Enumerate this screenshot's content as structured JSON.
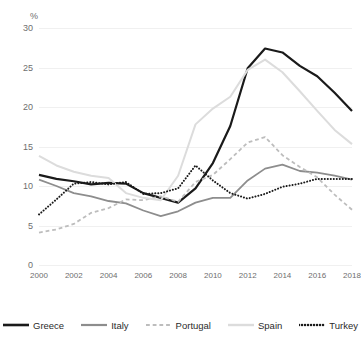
{
  "chart_data": {
    "type": "line",
    "title": "",
    "xlabel": "",
    "ylabel": "%",
    "unit_label": "%",
    "grid": true,
    "legend_position": "bottom",
    "xlim": [
      2000,
      2018
    ],
    "ylim": [
      0,
      30
    ],
    "yticks": [
      0,
      5,
      10,
      15,
      20,
      25,
      30
    ],
    "ytick_labels": [
      "0",
      "5",
      "10",
      "15",
      "20",
      "25",
      "30"
    ],
    "xticks": [
      2000,
      2002,
      2004,
      2006,
      2008,
      2010,
      2012,
      2014,
      2016,
      2018
    ],
    "xtick_labels": [
      "2000",
      "2002",
      "2004",
      "2006",
      "2008",
      "2010",
      "2012",
      "2014",
      "2016",
      "2018"
    ],
    "x": [
      2000,
      2001,
      2002,
      2003,
      2004,
      2005,
      2006,
      2007,
      2008,
      2009,
      2010,
      2011,
      2012,
      2013,
      2014,
      2015,
      2016,
      2017,
      2018
    ],
    "series": [
      {
        "name": "Greece",
        "color": "#1a1a1a",
        "style": "solid",
        "width": 2.2,
        "values": [
          11.4,
          10.9,
          10.6,
          10.2,
          10.4,
          10.3,
          9.1,
          8.5,
          7.9,
          9.7,
          12.9,
          17.6,
          24.9,
          27.4,
          26.9,
          25.2,
          23.9,
          21.8,
          19.5
        ]
      },
      {
        "name": "Italy",
        "color": "#8d8d8d",
        "style": "solid",
        "width": 1.8,
        "values": [
          10.8,
          10.0,
          9.1,
          8.7,
          8.1,
          7.8,
          6.9,
          6.2,
          6.8,
          7.9,
          8.5,
          8.5,
          10.7,
          12.2,
          12.7,
          11.9,
          11.7,
          11.3,
          10.8
        ]
      },
      {
        "name": "Portugal",
        "color": "#bdbdbd",
        "style": "dashed",
        "width": 1.8,
        "values": [
          4.1,
          4.5,
          5.2,
          6.6,
          7.2,
          8.3,
          8.2,
          8.7,
          8.0,
          10.5,
          11.4,
          13.4,
          15.5,
          16.2,
          13.9,
          12.4,
          11.1,
          8.9,
          7.0
        ]
      },
      {
        "name": "Spain",
        "color": "#dcdcdc",
        "style": "solid",
        "width": 2.0,
        "values": [
          13.8,
          12.6,
          11.8,
          11.3,
          11.0,
          9.1,
          8.5,
          8.2,
          11.3,
          17.8,
          19.8,
          21.3,
          24.7,
          26.0,
          24.4,
          22.0,
          19.5,
          17.1,
          15.3
        ]
      },
      {
        "name": "Turkey",
        "color": "#1a1a1a",
        "style": "dotted",
        "width": 2.0,
        "values": [
          6.4,
          8.3,
          10.3,
          10.5,
          10.2,
          10.5,
          9.0,
          9.1,
          9.7,
          12.6,
          10.7,
          9.1,
          8.4,
          9.0,
          9.9,
          10.3,
          10.9,
          10.9,
          10.9
        ]
      }
    ]
  }
}
